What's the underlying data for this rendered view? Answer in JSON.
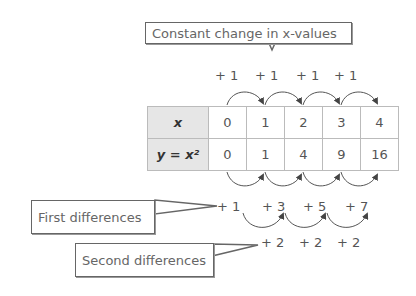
{
  "callouts": {
    "x_change": "Constant change in x-values",
    "first": "First differences",
    "second": "Second differences"
  },
  "top_diffs": [
    "+ 1",
    "+ 1",
    "+ 1",
    "+ 1"
  ],
  "table": {
    "row_headers": [
      "x",
      "y = x²"
    ],
    "x_values": [
      "0",
      "1",
      "2",
      "3",
      "4"
    ],
    "y_values": [
      "0",
      "1",
      "4",
      "9",
      "16"
    ]
  },
  "first_differences": [
    "+ 1",
    "+ 3",
    "+ 5",
    "+ 7"
  ],
  "second_differences": [
    "+ 2",
    "+ 2",
    "+ 2"
  ]
}
